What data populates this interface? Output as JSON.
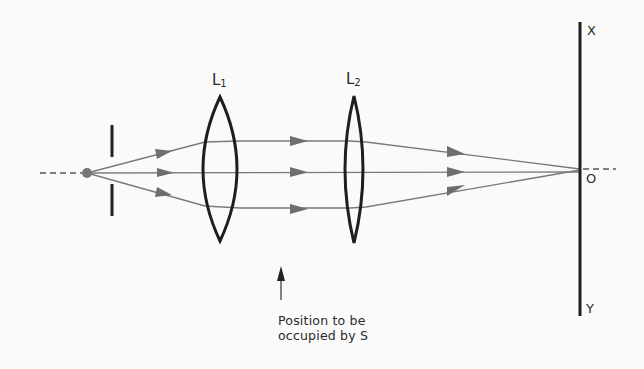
{
  "diagram": {
    "type": "optical-ray-diagram",
    "colors": {
      "background": "#fafafa",
      "ink": "#222222",
      "ray": "#7a7a7a",
      "arrowhead": "#6e6e6e"
    },
    "elements": {
      "source_point": {
        "x": 87,
        "y": 173
      },
      "aperture": {
        "x": 112
      },
      "lens1": {
        "label_main": "L",
        "label_sub": "1",
        "x": 220
      },
      "lens2": {
        "label_main": "L",
        "label_sub": "2",
        "x": 354
      },
      "screen": {
        "x": 580,
        "top_label": "X",
        "origin_label": "O",
        "bottom_label": "Y"
      }
    },
    "annotation": {
      "line1": "Position to be",
      "line2": "occupied by S"
    }
  }
}
